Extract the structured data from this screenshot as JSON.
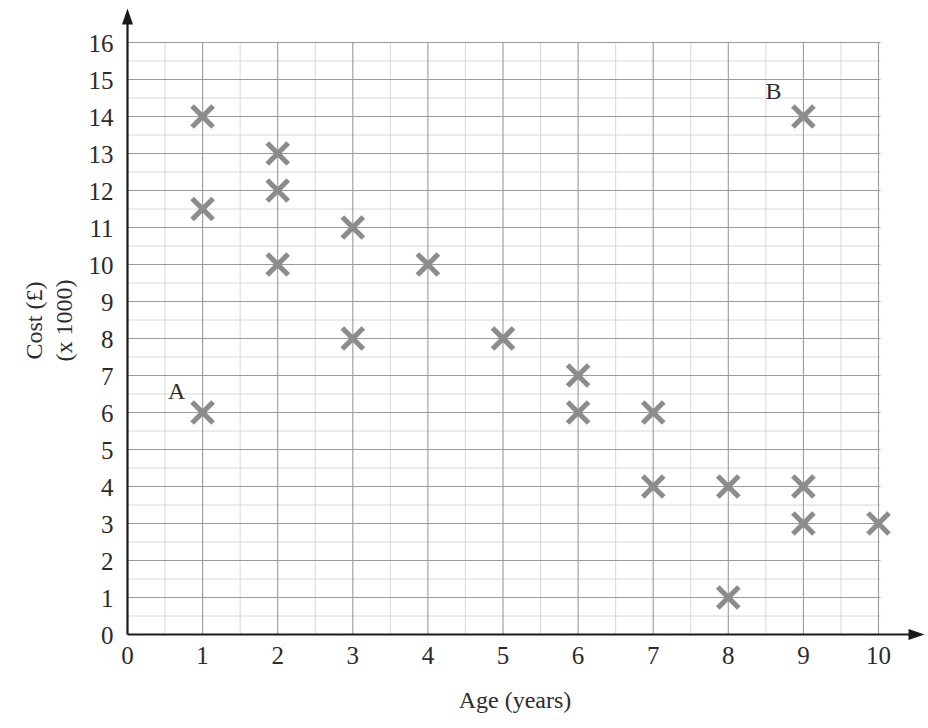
{
  "chart_data": {
    "type": "scatter",
    "title": "",
    "xlabel": "Age (years)",
    "ylabel_line1": "Cost (£)",
    "ylabel_line2": "(x 1000)",
    "xlim": [
      0,
      10
    ],
    "ylim": [
      0,
      16
    ],
    "x_ticks": [
      0,
      1,
      2,
      3,
      4,
      5,
      6,
      7,
      8,
      9,
      10
    ],
    "x_tick_labels": [
      "0",
      "1",
      "2",
      "3",
      "4",
      "5",
      "6",
      "7",
      "8",
      "9",
      "10"
    ],
    "y_ticks": [
      0,
      1,
      2,
      3,
      4,
      5,
      6,
      7,
      8,
      9,
      10,
      11,
      12,
      13,
      14,
      15,
      16
    ],
    "y_tick_labels": [
      "0",
      "1",
      "2",
      "3",
      "4",
      "5",
      "6",
      "7",
      "8",
      "9",
      "10",
      "11",
      "12",
      "13",
      "14",
      "15",
      "16"
    ],
    "grid": true,
    "minor_grid": true,
    "minor_grid_step": 0.5,
    "marker": "x-cross",
    "marker_color": "#8c8c8c",
    "grid_major_color": "#9a9a9a",
    "grid_minor_color": "#d8d8d8",
    "axis_color": "#1a1a1a",
    "points": [
      {
        "x": 1,
        "y": 14,
        "label": ""
      },
      {
        "x": 1,
        "y": 11.5,
        "label": ""
      },
      {
        "x": 1,
        "y": 6,
        "label": "A"
      },
      {
        "x": 2,
        "y": 13,
        "label": ""
      },
      {
        "x": 2,
        "y": 12,
        "label": ""
      },
      {
        "x": 2,
        "y": 10,
        "label": ""
      },
      {
        "x": 3,
        "y": 11,
        "label": ""
      },
      {
        "x": 3,
        "y": 8,
        "label": ""
      },
      {
        "x": 4,
        "y": 10,
        "label": ""
      },
      {
        "x": 5,
        "y": 8,
        "label": ""
      },
      {
        "x": 6,
        "y": 7,
        "label": ""
      },
      {
        "x": 6,
        "y": 6,
        "label": ""
      },
      {
        "x": 7,
        "y": 6,
        "label": ""
      },
      {
        "x": 7,
        "y": 4,
        "label": ""
      },
      {
        "x": 8,
        "y": 4,
        "label": ""
      },
      {
        "x": 8,
        "y": 1,
        "label": ""
      },
      {
        "x": 9,
        "y": 14,
        "label": "B"
      },
      {
        "x": 9,
        "y": 4,
        "label": ""
      },
      {
        "x": 9,
        "y": 3,
        "label": ""
      },
      {
        "x": 10,
        "y": 3,
        "label": ""
      }
    ],
    "annotations": [
      {
        "text": "A",
        "x": 1,
        "y": 6,
        "dx": -26,
        "dy": -14
      },
      {
        "text": "B",
        "x": 9,
        "y": 14,
        "dx": -30,
        "dy": -18
      }
    ]
  }
}
